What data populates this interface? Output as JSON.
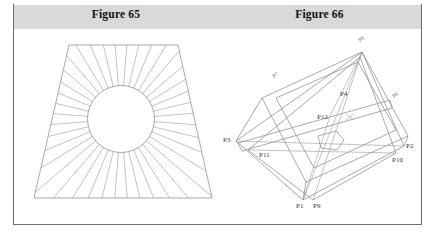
{
  "page": {
    "background_color": "#ffffff",
    "frame_color": "#6e6e6e",
    "caption_band_color": "#d9d9d9",
    "line_color": "#8d8d8d"
  },
  "captions": {
    "left": "Figure 65",
    "right": "Figure 66"
  },
  "figure65": {
    "title": "Figure 65",
    "description": "Trapezoid with inscribed circle and radiating lines",
    "outline": [
      {
        "x": 55,
        "y": 15
      },
      {
        "x": 164,
        "y": 15
      },
      {
        "x": 198,
        "y": 168
      },
      {
        "x": 20,
        "y": 168
      }
    ],
    "circle": {
      "cx": 107,
      "cy": 89,
      "r": 33.5
    },
    "ray_count": 40
  },
  "figure66": {
    "title": "Figure 66",
    "description": "Isometric solid with labelled vertices",
    "vertices": [
      {
        "id": "P3",
        "label": "P3",
        "x": 18,
        "y": 111,
        "label_x": 5,
        "label_y": 112,
        "anchor": "start"
      },
      {
        "id": "P11",
        "label": "P11",
        "x": 30,
        "y": 120,
        "label_x": 41,
        "label_y": 127,
        "anchor": "start"
      },
      {
        "id": "P1",
        "label": "P1",
        "x": 85,
        "y": 170,
        "label_x": 78,
        "label_y": 178,
        "anchor": "start"
      },
      {
        "id": "P9",
        "label": "P9",
        "x": 95,
        "y": 170,
        "label_x": 95,
        "label_y": 178,
        "anchor": "start"
      },
      {
        "id": "P10",
        "label": "P10",
        "x": 178,
        "y": 123,
        "label_x": 174,
        "label_y": 132,
        "anchor": "start"
      },
      {
        "id": "P2",
        "label": "P2",
        "x": 186,
        "y": 116,
        "label_x": 188,
        "label_y": 118,
        "anchor": "start"
      },
      {
        "id": "P4",
        "label": "P4",
        "x": 118,
        "y": 62,
        "label_x": 122,
        "label_y": 66,
        "anchor": "start"
      },
      {
        "id": "P12",
        "label": "P12",
        "x": 112,
        "y": 86,
        "label_x": 99,
        "label_y": 89,
        "anchor": "start"
      }
    ],
    "edge_labels": [
      {
        "id": "P7",
        "label": "P7",
        "x": 56,
        "y": 48,
        "rotation": -35
      },
      {
        "id": "P8",
        "label": "P8",
        "x": 142,
        "y": 12,
        "rotation": -35
      },
      {
        "id": "P6",
        "label": "P6",
        "x": 176,
        "y": 68,
        "rotation": -35
      }
    ],
    "apex": {
      "x": 144,
      "y": 22
    },
    "top_face": [
      {
        "x": 44,
        "y": 68
      },
      {
        "x": 144,
        "y": 22
      },
      {
        "x": 190,
        "y": 106
      },
      {
        "x": 88,
        "y": 152
      }
    ],
    "inner_face": [
      {
        "x": 58,
        "y": 68
      },
      {
        "x": 140,
        "y": 32
      },
      {
        "x": 178,
        "y": 100
      },
      {
        "x": 96,
        "y": 138
      }
    ]
  }
}
